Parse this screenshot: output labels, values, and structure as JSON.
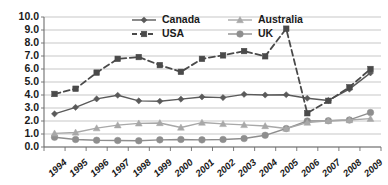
{
  "chart_data": {
    "type": "line",
    "title": "",
    "xlabel": "",
    "ylabel": "",
    "ylim": [
      0.0,
      10.0
    ],
    "ytick_step": 1.0,
    "grid": true,
    "legend_position": "top-inside",
    "categories": [
      "1994",
      "1995",
      "1996",
      "1997",
      "1998",
      "1999",
      "2000",
      "2001",
      "2002",
      "2003",
      "2004",
      "2005",
      "2006",
      "2007",
      "2008",
      "2009"
    ],
    "ytick_labels": [
      "10.0",
      "9.0",
      "8.0",
      "7.0",
      "6.0",
      "5.0",
      "4.0",
      "3.0",
      "2.0",
      "1.0",
      "0.0"
    ],
    "series": [
      {
        "name": "Canada",
        "marker": "diamond",
        "line_style": "solid",
        "color": "#5a5a5a",
        "values": [
          2.55,
          3.05,
          3.7,
          3.98,
          3.55,
          3.52,
          3.68,
          3.85,
          3.8,
          4.05,
          4.0,
          4.02,
          3.75,
          3.58,
          4.45,
          5.7
        ]
      },
      {
        "name": "USA",
        "marker": "square",
        "line_style": "dashed",
        "color": "#4a4a4a",
        "values": [
          4.08,
          4.48,
          5.72,
          6.78,
          6.92,
          6.3,
          5.78,
          6.78,
          7.05,
          7.38,
          6.98,
          9.1,
          2.6,
          3.55,
          4.6,
          6.0
        ]
      },
      {
        "name": "Australia",
        "marker": "triangle",
        "line_style": "solid",
        "color": "#a8a8a8",
        "values": [
          1.05,
          1.12,
          1.45,
          1.68,
          1.82,
          1.85,
          1.5,
          1.88,
          1.78,
          1.7,
          1.62,
          1.42,
          1.88,
          2.02,
          2.08,
          2.18
        ]
      },
      {
        "name": "UK",
        "marker": "circle",
        "line_style": "solid",
        "color": "#8e8e8e",
        "values": [
          0.75,
          0.58,
          0.52,
          0.5,
          0.48,
          0.55,
          0.58,
          0.55,
          0.58,
          0.65,
          0.9,
          1.42,
          2.0,
          2.02,
          2.08,
          2.65
        ]
      }
    ]
  }
}
